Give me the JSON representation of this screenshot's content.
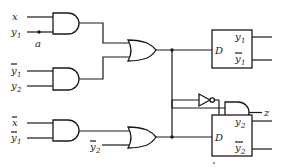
{
  "diagram": {
    "type": "logic-circuit",
    "inputs": [
      {
        "id": "x",
        "label": "x",
        "sub": "",
        "bar": false
      },
      {
        "id": "y1",
        "label": "y",
        "sub": "1",
        "bar": false
      },
      {
        "id": "y1bar_a",
        "label": "y",
        "sub": "1",
        "bar": true
      },
      {
        "id": "y2",
        "label": "y",
        "sub": "2",
        "bar": false
      },
      {
        "id": "xbar",
        "label": "x",
        "sub": "",
        "bar": true
      },
      {
        "id": "y1bar_b",
        "label": "y",
        "sub": "1",
        "bar": true
      },
      {
        "id": "y2bar",
        "label": "y",
        "sub": "2",
        "bar": true
      }
    ],
    "node_label": "a",
    "flipflops": [
      {
        "id": "ff1",
        "input_label": "D",
        "q_label": "y",
        "q_sub": "1",
        "qbar_label": "y",
        "qbar_sub": "1"
      },
      {
        "id": "ff2",
        "input_label": "D",
        "q_label": "y",
        "q_sub": "2",
        "qbar_label": "y",
        "qbar_sub": "2"
      }
    ],
    "output_label": "z",
    "gates": [
      {
        "id": "and1",
        "type": "AND",
        "inputs": [
          "x",
          "y1"
        ]
      },
      {
        "id": "and2",
        "type": "AND",
        "inputs": [
          "y1bar",
          "y2"
        ]
      },
      {
        "id": "or1",
        "type": "OR",
        "inputs": [
          "and1",
          "and2"
        ],
        "drives": "ff1.D"
      },
      {
        "id": "and4",
        "type": "AND",
        "inputs": [
          "xbar",
          "y1bar"
        ]
      },
      {
        "id": "or2",
        "type": "OR",
        "inputs": [
          "and4",
          "y2bar"
        ],
        "drives": "ff2.D"
      },
      {
        "id": "not1",
        "type": "NOT",
        "inputs": [
          "or2"
        ]
      },
      {
        "id": "and3",
        "type": "AND",
        "inputs": [
          "or1",
          "not1"
        ],
        "drives": "z"
      }
    ]
  }
}
